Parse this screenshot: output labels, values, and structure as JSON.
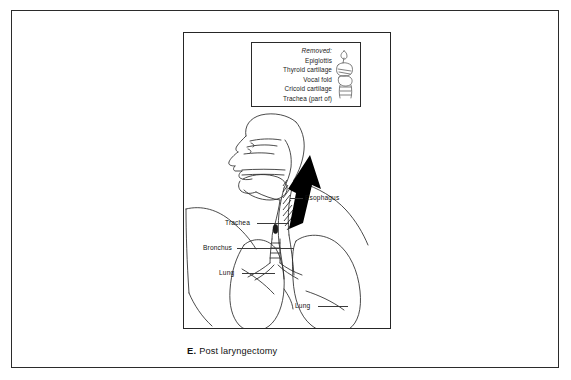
{
  "figure": {
    "caption_letter": "E.",
    "caption_text": "Post laryngectomy",
    "legend": {
      "title": "Removed:",
      "items": [
        "Epiglottis",
        "Thyroid cartilage",
        "Vocal fold",
        "Cricoid cartilage",
        "Trachea (part of)"
      ],
      "sketch_name": "larynx-cartilage-sketch"
    },
    "labels": {
      "esophagus": "Esophagus",
      "trachea": "Trachea",
      "bronchus": "Bronchus",
      "lung_left": "Lung",
      "lung_right": "Lung"
    },
    "colors": {
      "ink": "#111111",
      "line": "#2b2b2b",
      "arrow_fill": "#000000",
      "paper": "#ffffff"
    }
  }
}
